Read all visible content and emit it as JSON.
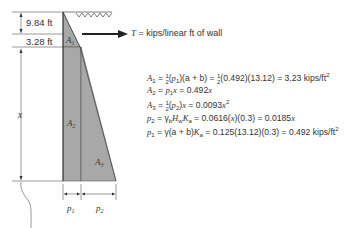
{
  "diagram": {
    "dimensions": {
      "top": "9.84 ft",
      "second": "3.28 ft",
      "depth_var": "x"
    },
    "areas": [
      "A1",
      "A2",
      "A3"
    ],
    "pressure_labels": [
      "p1",
      "p2"
    ],
    "force_label": "T = kips/linear ft of wall",
    "colors": {
      "fill": "#a8a8a8",
      "line": "#333333",
      "background": "#ffffff"
    }
  },
  "equations": [
    {
      "lhs": "A1",
      "rhs": " = ½(p1)(a + b) = ½(0.492)(13.12) = 3.23 kips/ft²"
    },
    {
      "lhs": "A2",
      "rhs": " = p1x = 0.492x"
    },
    {
      "lhs": "A3",
      "rhs": " = ½(p2)x = 0.0093x²"
    },
    {
      "lhs": "p2",
      "rhs": " = γbHwKa = 0.0616(x)(0.3) = 0.0185x"
    },
    {
      "lhs": "p1",
      "rhs": " = γ(a + b)Ka = 0.125(13.12)(0.3) = 0.492 kips/ft²"
    }
  ]
}
